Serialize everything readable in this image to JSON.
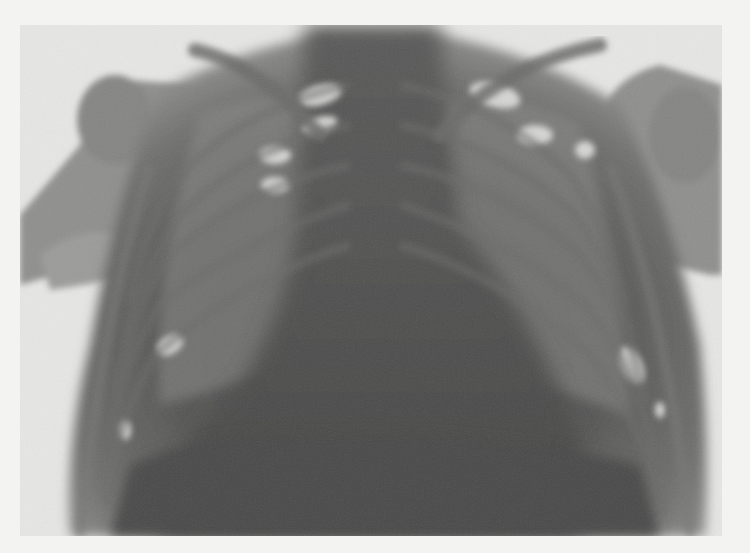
{
  "image": {
    "kind": "chest radiograph (negative print)",
    "view": "frontal",
    "palette": {
      "background": "#f3f3f1",
      "film_light": "#e6e6e4",
      "soft_tissue": "#8d8d8b",
      "mediastinum": "#4f4f4e",
      "bone": "#7a7a78",
      "lung_highlight": "#dcdcda"
    },
    "regions": [
      "left-shoulder",
      "right-shoulder",
      "left-clavicle",
      "right-clavicle",
      "ribcage",
      "mediastinum",
      "heart-shadow",
      "diaphragm"
    ]
  }
}
